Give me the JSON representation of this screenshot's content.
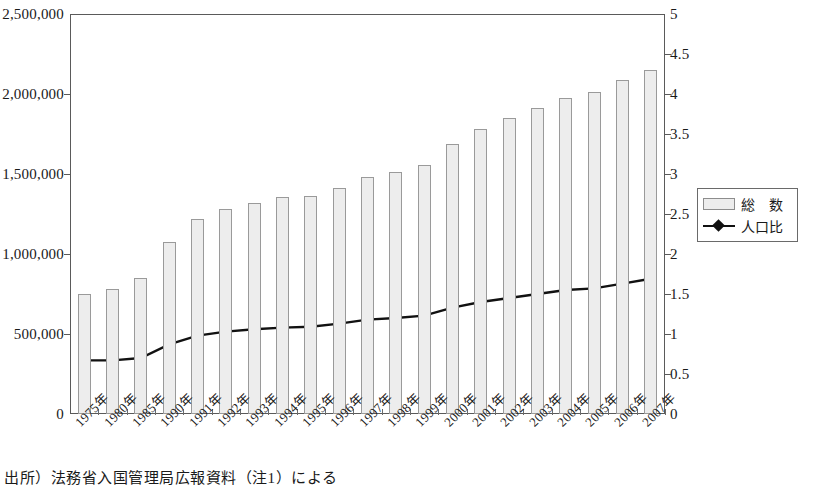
{
  "chart_data": {
    "type": "bar",
    "title": "",
    "xlabel": "",
    "ylabel": "",
    "grid": false,
    "legend_position": "right",
    "categories": [
      "1975年",
      "1980年",
      "1985年",
      "1990年",
      "1991年",
      "1992年",
      "1993年",
      "1994年",
      "1995年",
      "1996年",
      "1997年",
      "1998年",
      "1999年",
      "2000年",
      "2001年",
      "2002年",
      "2003年",
      "2004年",
      "2005年",
      "2006年",
      "2007年"
    ],
    "left_axis": {
      "name": "総　数",
      "ticks": [
        "0",
        "500,000",
        "1,000,000",
        "1,500,000",
        "2,000,000",
        "2,500,000"
      ],
      "tick_values": [
        0,
        500000,
        1000000,
        1500000,
        2000000,
        2500000
      ],
      "ylim": [
        0,
        2500000
      ]
    },
    "right_axis": {
      "name": "人口比",
      "ticks": [
        "0",
        "0.5",
        "1",
        "1.5",
        "2",
        "2.5",
        "3",
        "3.5",
        "4",
        "4.5",
        "5"
      ],
      "tick_values": [
        0,
        0.5,
        1,
        1.5,
        2,
        2.5,
        3,
        3.5,
        4,
        4.5,
        5
      ],
      "ylim": [
        0,
        5
      ]
    },
    "series": [
      {
        "name": "総　数",
        "type": "bar",
        "axis": "left",
        "color": "#ededed",
        "border_color": "#9a9a9a",
        "values": [
          751842,
          782910,
          850612,
          1075317,
          1218891,
          1281644,
          1320748,
          1354011,
          1362371,
          1415136,
          1482707,
          1512116,
          1556113,
          1686444,
          1778462,
          1851758,
          1915030,
          1973747,
          2011555,
          2084919,
          2152973
        ]
      },
      {
        "name": "人口比",
        "type": "line",
        "axis": "right",
        "color": "#111111",
        "marker": "diamond",
        "values": [
          0.67,
          0.67,
          0.7,
          0.87,
          0.98,
          1.03,
          1.06,
          1.08,
          1.09,
          1.13,
          1.18,
          1.2,
          1.23,
          1.33,
          1.4,
          1.45,
          1.5,
          1.55,
          1.57,
          1.63,
          1.69
        ]
      }
    ]
  },
  "legend": {
    "items": [
      {
        "label": "総　数",
        "marker": "bar-swatch"
      },
      {
        "label": "人口比",
        "marker": "line-diamond-swatch"
      }
    ]
  },
  "source": {
    "text": "出所）法務省入国管理局広報資料（注1）による"
  },
  "colors": {
    "bar_fill": "#ededed",
    "bar_border": "#9a9a9a",
    "line": "#111111",
    "axis": "#5a5a5a",
    "text": "#1a1a1a",
    "background": "#ffffff"
  }
}
